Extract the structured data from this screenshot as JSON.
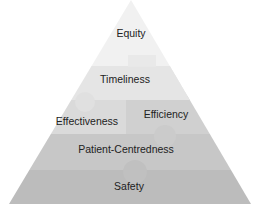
{
  "diagram": {
    "type": "pyramid",
    "style": "puzzle-layers",
    "layers": [
      {
        "id": "equity",
        "label": "Equity",
        "color": "#f1f1f1"
      },
      {
        "id": "timeliness",
        "label": "Timeliness",
        "color": "#e5e5e5"
      },
      {
        "id": "effectiveness",
        "label": "Effectiveness",
        "color": "#dadada"
      },
      {
        "id": "efficiency",
        "label": "Efficiency",
        "color": "#d0d0d0"
      },
      {
        "id": "patient-centredness",
        "label": "Patient-Centredness",
        "color": "#c7c7c7"
      },
      {
        "id": "safety",
        "label": "Safety",
        "color": "#bcbcbc"
      }
    ],
    "text_color": "#222222"
  }
}
